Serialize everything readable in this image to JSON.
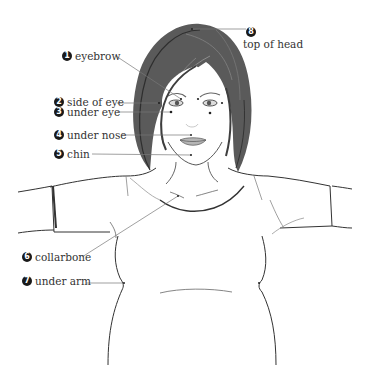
{
  "diagram": {
    "type": "acupressure-tapping-points",
    "colors": {
      "line": "#555555",
      "hair": "#4a4a4a",
      "badge": "#1a1a1a",
      "text": "#333333"
    },
    "points": [
      {
        "number": "1",
        "label": "eyebrow"
      },
      {
        "number": "2",
        "label": "side of eye"
      },
      {
        "number": "3",
        "label": "under eye"
      },
      {
        "number": "4",
        "label": "under nose"
      },
      {
        "number": "5",
        "label": "chin"
      },
      {
        "number": "6",
        "label": "collarbone"
      },
      {
        "number": "7",
        "label": "under arm"
      },
      {
        "number": "8",
        "label": "top of head"
      }
    ]
  }
}
